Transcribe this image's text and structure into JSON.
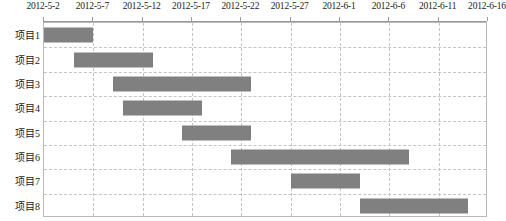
{
  "chart_data": {
    "type": "bar",
    "title": "",
    "xlabel": "",
    "ylabel": "",
    "orientation": "horizontal",
    "chart_kind": "gantt",
    "grid": true,
    "legend": "none",
    "bar_color": "#808080",
    "axis_color": "#9a9a9a",
    "grid_color": "#c4c4c4",
    "frame_color": "#b9b9b9",
    "x_axis_position": "top",
    "x_ticklabels": [
      "2012-5-2",
      "2012-5-7",
      "2012-5-12",
      "2012-5-17",
      "2012-5-22",
      "2012-5-27",
      "2012-6-1",
      "2012-6-6",
      "2012-6-11",
      "2012-6-16"
    ],
    "x_tickvalues": [
      0,
      5,
      10,
      15,
      20,
      25,
      30,
      35,
      40,
      45
    ],
    "xlim_days": [
      0,
      45
    ],
    "xlim_dates": [
      "2012-5-2",
      "2012-6-16"
    ],
    "day_unit": "days since 2012-5-2",
    "categories": [
      "项目1",
      "项目2",
      "项目3",
      "项目4",
      "项目5",
      "项目6",
      "项目7",
      "项目8"
    ],
    "tasks": [
      {
        "label": "项目1",
        "start_date": "2012-5-2",
        "end_date": "2012-5-7",
        "start_day": 0,
        "end_day": 5,
        "duration_days": 5
      },
      {
        "label": "项目2",
        "start_date": "2012-5-5",
        "end_date": "2012-5-13",
        "start_day": 3,
        "end_day": 11,
        "duration_days": 8
      },
      {
        "label": "项目3",
        "start_date": "2012-5-9",
        "end_date": "2012-5-23",
        "start_day": 7,
        "end_day": 21,
        "duration_days": 14
      },
      {
        "label": "项目4",
        "start_date": "2012-5-10",
        "end_date": "2012-5-18",
        "start_day": 8,
        "end_day": 16,
        "duration_days": 8
      },
      {
        "label": "项目5",
        "start_date": "2012-5-16",
        "end_date": "2012-5-23",
        "start_day": 14,
        "end_day": 21,
        "duration_days": 7
      },
      {
        "label": "项目6",
        "start_date": "2012-5-21",
        "end_date": "2012-6-8",
        "start_day": 19,
        "end_day": 37,
        "duration_days": 18
      },
      {
        "label": "项目7",
        "start_date": "2012-5-27",
        "end_date": "2012-6-3",
        "start_day": 25,
        "end_day": 32,
        "duration_days": 7
      },
      {
        "label": "项目8",
        "start_date": "2012-6-3",
        "end_date": "2012-6-14",
        "start_day": 32,
        "end_day": 43,
        "duration_days": 11
      }
    ]
  }
}
